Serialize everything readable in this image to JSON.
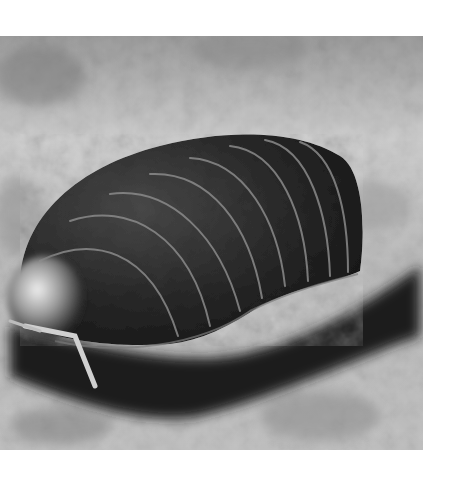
{
  "image": {
    "subject": "pill bug (woodlouse) on ground",
    "alt": "Black-and-white close-up photograph of a pill bug crawling over rough ground",
    "color_mode": "grayscale",
    "frame": {
      "left": 0,
      "top": 36,
      "width": 423,
      "height": 414
    },
    "colors": {
      "background": "#ffffff",
      "ground_light": "#d6d6d6",
      "ground_mid": "#a8a8a8",
      "shadow": "#2a2a2a",
      "shell_dark": "#1e1e1e",
      "shell_mid": "#3a3a3a",
      "segment_line": "#8a8a8a",
      "highlight": "#e8e8e8"
    },
    "segment_count": 9
  }
}
